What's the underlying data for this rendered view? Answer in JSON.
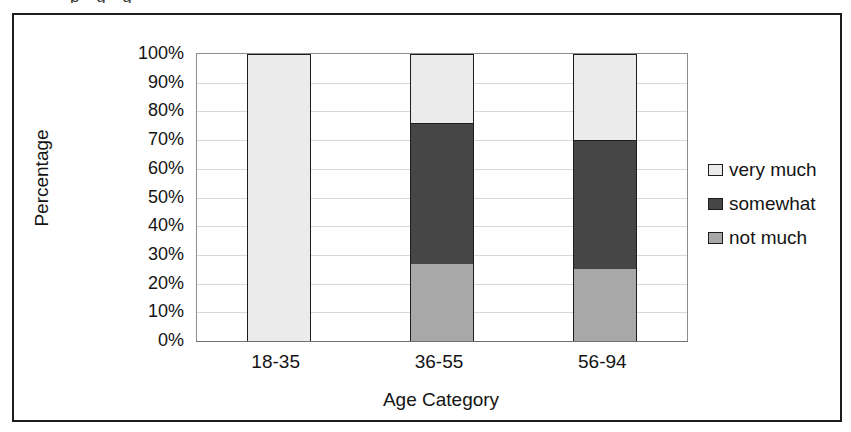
{
  "figure": {
    "top_caption_sliver": "p                                 g       g"
  },
  "axes": {
    "y_title": "Percentage",
    "x_title": "Age Category",
    "y_ticks": [
      "100%",
      "90%",
      "80%",
      "70%",
      "60%",
      "50%",
      "40%",
      "30%",
      "20%",
      "10%",
      "0%"
    ],
    "x_ticks": [
      "18-35",
      "36-55",
      "56-94"
    ]
  },
  "legend": {
    "items": [
      {
        "label": "very much",
        "color": "#ebebeb"
      },
      {
        "label": "somewhat",
        "color": "#464646"
      },
      {
        "label": "not much",
        "color": "#a8a8a8"
      }
    ]
  },
  "colors": {
    "very_much": "#ebebeb",
    "somewhat": "#464646",
    "not_much": "#a8a8a8",
    "outline": "#1d1d1d",
    "grid": "#d9d9d9",
    "frame": "#1c1c1c",
    "text": "#141414"
  },
  "chart_data": {
    "type": "bar",
    "title": "",
    "subtitle": "",
    "stacked": true,
    "xlabel": "Age Category",
    "ylabel": "Percentage",
    "categories": [
      "18-35",
      "36-55",
      "56-94"
    ],
    "ylim": [
      0,
      100
    ],
    "yticks": [
      0,
      10,
      20,
      30,
      40,
      50,
      60,
      70,
      80,
      90,
      100
    ],
    "ytick_labels": [
      "0%",
      "10%",
      "20%",
      "30%",
      "40%",
      "50%",
      "60%",
      "70%",
      "80%",
      "90%",
      "100%"
    ],
    "grid": true,
    "grid_axis": "y",
    "legend_position": "right",
    "series": [
      {
        "name": "not much",
        "color": "#a8a8a8",
        "values": [
          0,
          27,
          25
        ]
      },
      {
        "name": "somewhat",
        "color": "#464646",
        "values": [
          0,
          49,
          45
        ]
      },
      {
        "name": "very much",
        "color": "#ebebeb",
        "values": [
          100,
          24,
          30
        ]
      }
    ],
    "stack_order_bottom_to_top": [
      "not much",
      "somewhat",
      "very much"
    ],
    "annotations": []
  }
}
